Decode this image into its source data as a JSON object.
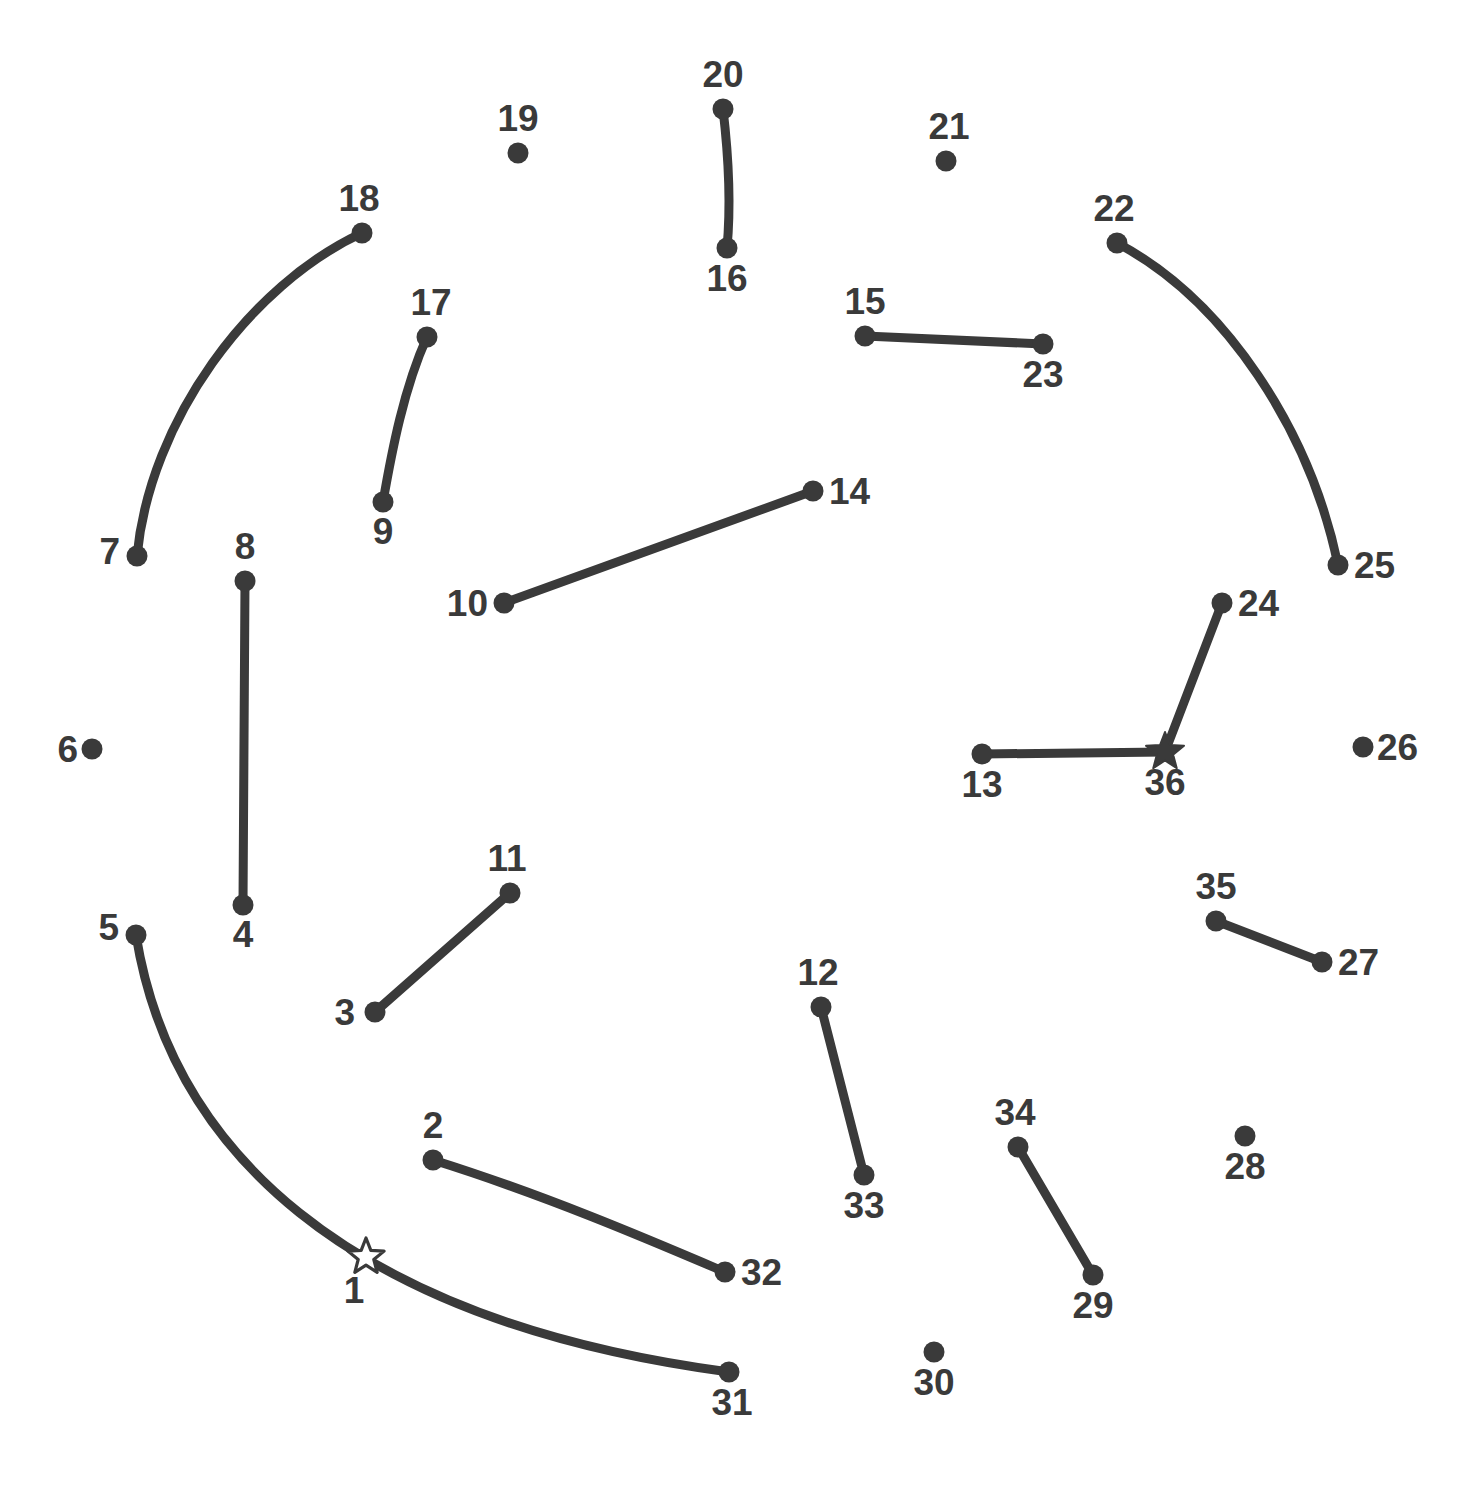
{
  "page": {
    "width": 1472,
    "height": 1501,
    "background_color": "#ffffff",
    "ink_color": "#3a3a3a"
  },
  "chart_data": {
    "type": "scatter",
    "title": "",
    "xlabel": "",
    "ylabel": "",
    "xlim": [
      0,
      1472
    ],
    "ylim": [
      0,
      1501
    ],
    "grid": false,
    "legend": "none",
    "point_labels": [
      "1",
      "2",
      "3",
      "4",
      "5",
      "6",
      "7",
      "8",
      "9",
      "10",
      "11",
      "12",
      "13",
      "14",
      "15",
      "16",
      "17",
      "18",
      "19",
      "20",
      "21",
      "22",
      "23",
      "24",
      "25",
      "26",
      "27",
      "28",
      "29",
      "30",
      "31",
      "32",
      "33",
      "34",
      "35",
      "36"
    ],
    "points": [
      {
        "id": "1",
        "label": "1",
        "x": 366,
        "y": 1257,
        "marker": "star-hollow",
        "label_dx": -12,
        "label_dy": 46,
        "label_anchor": "middle"
      },
      {
        "id": "2",
        "label": "2",
        "x": 433,
        "y": 1160,
        "marker": "circle",
        "label_dx": 0,
        "label_dy": -22,
        "label_anchor": "middle"
      },
      {
        "id": "3",
        "label": "3",
        "x": 375,
        "y": 1012,
        "marker": "circle",
        "label_dx": -20,
        "label_dy": 13,
        "label_anchor": "end"
      },
      {
        "id": "4",
        "label": "4",
        "x": 243,
        "y": 905,
        "marker": "circle",
        "label_dx": 0,
        "label_dy": 42,
        "label_anchor": "middle"
      },
      {
        "id": "5",
        "label": "5",
        "x": 136,
        "y": 935,
        "marker": "circle",
        "label_dx": -17,
        "label_dy": 5,
        "label_anchor": "end"
      },
      {
        "id": "6",
        "label": "6",
        "x": 92,
        "y": 749,
        "marker": "circle",
        "label_dx": -14,
        "label_dy": 13,
        "label_anchor": "end"
      },
      {
        "id": "7",
        "label": "7",
        "x": 137,
        "y": 556,
        "marker": "circle",
        "label_dx": -17,
        "label_dy": 8,
        "label_anchor": "end"
      },
      {
        "id": "8",
        "label": "8",
        "x": 245,
        "y": 581,
        "marker": "circle",
        "label_dx": 0,
        "label_dy": -22,
        "label_anchor": "middle"
      },
      {
        "id": "9",
        "label": "9",
        "x": 383,
        "y": 502,
        "marker": "circle",
        "label_dx": 0,
        "label_dy": 42,
        "label_anchor": "middle"
      },
      {
        "id": "10",
        "label": "10",
        "x": 504,
        "y": 603,
        "marker": "circle",
        "label_dx": -16,
        "label_dy": 13,
        "label_anchor": "end"
      },
      {
        "id": "11",
        "label": "11",
        "x": 510,
        "y": 893,
        "marker": "circle",
        "label_dx": -3,
        "label_dy": -22,
        "label_anchor": "middle"
      },
      {
        "id": "12",
        "label": "12",
        "x": 821,
        "y": 1007,
        "marker": "circle",
        "label_dx": -3,
        "label_dy": -22,
        "label_anchor": "middle"
      },
      {
        "id": "13",
        "label": "13",
        "x": 982,
        "y": 754,
        "marker": "circle",
        "label_dx": 0,
        "label_dy": 43,
        "label_anchor": "middle"
      },
      {
        "id": "14",
        "label": "14",
        "x": 813,
        "y": 491,
        "marker": "circle",
        "label_dx": 16,
        "label_dy": 13,
        "label_anchor": "start"
      },
      {
        "id": "15",
        "label": "15",
        "x": 865,
        "y": 336,
        "marker": "circle",
        "label_dx": 0,
        "label_dy": -22,
        "label_anchor": "middle"
      },
      {
        "id": "16",
        "label": "16",
        "x": 727,
        "y": 248,
        "marker": "circle",
        "label_dx": 0,
        "label_dy": 43,
        "label_anchor": "middle"
      },
      {
        "id": "17",
        "label": "17",
        "x": 427,
        "y": 337,
        "marker": "circle",
        "label_dx": 4,
        "label_dy": -22,
        "label_anchor": "middle"
      },
      {
        "id": "18",
        "label": "18",
        "x": 362,
        "y": 233,
        "marker": "circle",
        "label_dx": -3,
        "label_dy": -22,
        "label_anchor": "middle"
      },
      {
        "id": "19",
        "label": "19",
        "x": 518,
        "y": 153,
        "marker": "circle",
        "label_dx": 0,
        "label_dy": -22,
        "label_anchor": "middle"
      },
      {
        "id": "20",
        "label": "20",
        "x": 723,
        "y": 109,
        "marker": "circle",
        "label_dx": 0,
        "label_dy": -22,
        "label_anchor": "middle"
      },
      {
        "id": "21",
        "label": "21",
        "x": 946,
        "y": 161,
        "marker": "circle",
        "label_dx": 3,
        "label_dy": -22,
        "label_anchor": "middle"
      },
      {
        "id": "22",
        "label": "22",
        "x": 1117,
        "y": 243,
        "marker": "circle",
        "label_dx": -3,
        "label_dy": -22,
        "label_anchor": "middle"
      },
      {
        "id": "23",
        "label": "23",
        "x": 1043,
        "y": 344,
        "marker": "circle",
        "label_dx": 0,
        "label_dy": 43,
        "label_anchor": "middle"
      },
      {
        "id": "24",
        "label": "24",
        "x": 1222,
        "y": 603,
        "marker": "circle",
        "label_dx": 16,
        "label_dy": 13,
        "label_anchor": "start"
      },
      {
        "id": "25",
        "label": "25",
        "x": 1338,
        "y": 565,
        "marker": "circle",
        "label_dx": 16,
        "label_dy": 13,
        "label_anchor": "start"
      },
      {
        "id": "26",
        "label": "26",
        "x": 1363,
        "y": 747,
        "marker": "circle",
        "label_dx": 14,
        "label_dy": 13,
        "label_anchor": "start"
      },
      {
        "id": "27",
        "label": "27",
        "x": 1322,
        "y": 962,
        "marker": "circle",
        "label_dx": 16,
        "label_dy": 13,
        "label_anchor": "start"
      },
      {
        "id": "28",
        "label": "28",
        "x": 1245,
        "y": 1136,
        "marker": "circle",
        "label_dx": 0,
        "label_dy": 43,
        "label_anchor": "middle"
      },
      {
        "id": "29",
        "label": "29",
        "x": 1093,
        "y": 1275,
        "marker": "circle",
        "label_dx": 0,
        "label_dy": 43,
        "label_anchor": "middle"
      },
      {
        "id": "30",
        "label": "30",
        "x": 934,
        "y": 1352,
        "marker": "circle",
        "label_dx": 0,
        "label_dy": 43,
        "label_anchor": "middle"
      },
      {
        "id": "31",
        "label": "31",
        "x": 729,
        "y": 1372,
        "marker": "circle",
        "label_dx": 3,
        "label_dy": 43,
        "label_anchor": "middle"
      },
      {
        "id": "32",
        "label": "32",
        "x": 725,
        "y": 1272,
        "marker": "circle",
        "label_dx": 16,
        "label_dy": 13,
        "label_anchor": "start"
      },
      {
        "id": "33",
        "label": "33",
        "x": 864,
        "y": 1175,
        "marker": "circle",
        "label_dx": 0,
        "label_dy": 43,
        "label_anchor": "middle"
      },
      {
        "id": "34",
        "label": "34",
        "x": 1018,
        "y": 1147,
        "marker": "circle",
        "label_dx": -3,
        "label_dy": -22,
        "label_anchor": "middle"
      },
      {
        "id": "35",
        "label": "35",
        "x": 1216,
        "y": 921,
        "marker": "circle",
        "label_dx": 0,
        "label_dy": -22,
        "label_anchor": "middle"
      },
      {
        "id": "36",
        "label": "36",
        "x": 1165,
        "y": 752,
        "marker": "star-solid",
        "label_dx": 0,
        "label_dy": 43,
        "label_anchor": "middle"
      }
    ],
    "edges": [
      {
        "id": "edge-7-18",
        "from": "7",
        "to": "18",
        "kind": "curve",
        "d": "M 137 556 C 150 420 250 285 362 233"
      },
      {
        "id": "edge-9-17",
        "from": "9",
        "to": "17",
        "kind": "curve",
        "d": "M 383 502 C 392 450 404 388 427 337"
      },
      {
        "id": "edge-20-16",
        "from": "20",
        "to": "16",
        "kind": "curve",
        "d": "M 723 109 C 729 160 731 205 727 248"
      },
      {
        "id": "edge-15-23",
        "from": "15",
        "to": "23",
        "kind": "line",
        "d": "M 865 336 L 1043 344"
      },
      {
        "id": "edge-22-25",
        "from": "22",
        "to": "25",
        "kind": "curve",
        "d": "M 1117 243 C 1225 300 1310 430 1338 565"
      },
      {
        "id": "edge-10-14",
        "from": "10",
        "to": "14",
        "kind": "line",
        "d": "M 504 603 L 813 491"
      },
      {
        "id": "edge-8-4",
        "from": "8",
        "to": "4",
        "kind": "line",
        "d": "M 245 581 L 243 905"
      },
      {
        "id": "edge-24-36",
        "from": "24",
        "to": "36",
        "kind": "line",
        "d": "M 1222 603 L 1165 752"
      },
      {
        "id": "edge-13-36",
        "from": "13",
        "to": "36",
        "kind": "line",
        "d": "M 982 754 L 1165 752"
      },
      {
        "id": "edge-3-11",
        "from": "3",
        "to": "11",
        "kind": "line",
        "d": "M 375 1012 L 510 893"
      },
      {
        "id": "edge-35-27",
        "from": "35",
        "to": "27",
        "kind": "line",
        "d": "M 1216 921 L 1322 962"
      },
      {
        "id": "edge-12-33",
        "from": "12",
        "to": "33",
        "kind": "line",
        "d": "M 821 1007 L 864 1175"
      },
      {
        "id": "edge-34-29",
        "from": "34",
        "to": "29",
        "kind": "line",
        "d": "M 1018 1147 L 1093 1275"
      },
      {
        "id": "edge-2-32",
        "from": "2",
        "to": "32",
        "kind": "curve",
        "d": "M 433 1160 C 545 1195 650 1240 725 1272"
      },
      {
        "id": "edge-5-31",
        "from": "5",
        "to": "31",
        "kind": "curve",
        "d": "M 136 935 C 170 1145 340 1320 729 1372"
      }
    ]
  }
}
